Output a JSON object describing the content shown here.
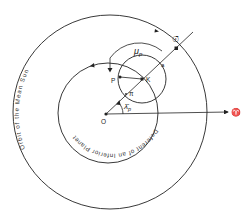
{
  "diagram": {
    "colors": {
      "ink": "#222222",
      "background": "#ffffff"
    },
    "curves": {
      "outer_orbit_label": "Orbit of the Mean Sun",
      "inner_deferent_label": "Deferent of an Inferior Planet"
    },
    "points": {
      "center": "O",
      "epicycle_center": "K",
      "planet": "P",
      "apogee": "a",
      "perigee": "π",
      "mean_sun": "☉̄"
    },
    "angles": {
      "anomaly": "μ",
      "anomaly_sub": "p",
      "mean_longitude": "λ̄",
      "mean_longitude_sub": "p"
    },
    "direction": {
      "vernal_point": "♈"
    }
  }
}
